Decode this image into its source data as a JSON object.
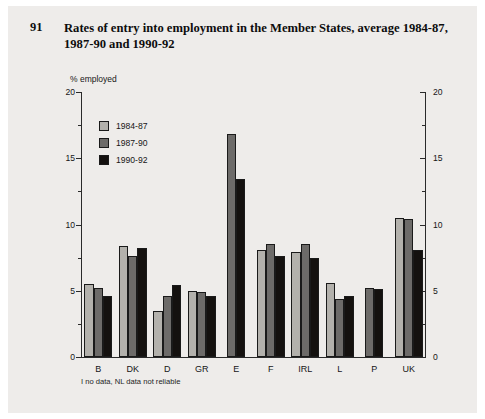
{
  "figure": {
    "number": "91",
    "title": "Rates of entry into employment in the Member States, average 1984-87, 1987-90 and 1990-92",
    "footnote": "I no data, NL data not reliable"
  },
  "legend": {
    "position": "upper-left-inside",
    "items": [
      {
        "label": "1984-87",
        "color": "#b3b1ac"
      },
      {
        "label": "1987-90",
        "color": "#6d6b69"
      },
      {
        "label": "1990-92",
        "color": "#14110f"
      }
    ]
  },
  "axes": {
    "y_title": "% employed",
    "y_ticks": [
      "0",
      "5",
      "10",
      "15",
      "20"
    ],
    "y_ticks_right": [
      "0",
      "5",
      "10",
      "15",
      "20"
    ]
  },
  "chart_data": {
    "type": "bar",
    "title": "Rates of entry into employment in the Member States, average 1984-87, 1987-90 and 1990-92",
    "xlabel": "",
    "ylabel": "% employed",
    "ylim": [
      0,
      20
    ],
    "ytick_step": 5,
    "minor_tick_step": 2.5,
    "grid": false,
    "legend_position": "upper left",
    "categories": [
      "B",
      "DK",
      "D",
      "GR",
      "E",
      "F",
      "IRL",
      "L",
      "P",
      "UK"
    ],
    "series": [
      {
        "name": "1984-87",
        "color": "#b3b1ac",
        "values": [
          5.5,
          8.4,
          3.5,
          5.0,
          null,
          8.1,
          7.9,
          5.6,
          null,
          10.5
        ]
      },
      {
        "name": "1987-90",
        "color": "#6d6b69",
        "values": [
          5.2,
          7.6,
          4.6,
          4.9,
          16.8,
          8.5,
          8.5,
          4.4,
          5.2,
          10.4
        ]
      },
      {
        "name": "1990-92",
        "color": "#14110f",
        "values": [
          4.6,
          8.2,
          5.4,
          4.6,
          13.4,
          7.6,
          7.5,
          4.6,
          5.1,
          8.1
        ]
      }
    ],
    "notes": "I no data, NL data not reliable"
  }
}
